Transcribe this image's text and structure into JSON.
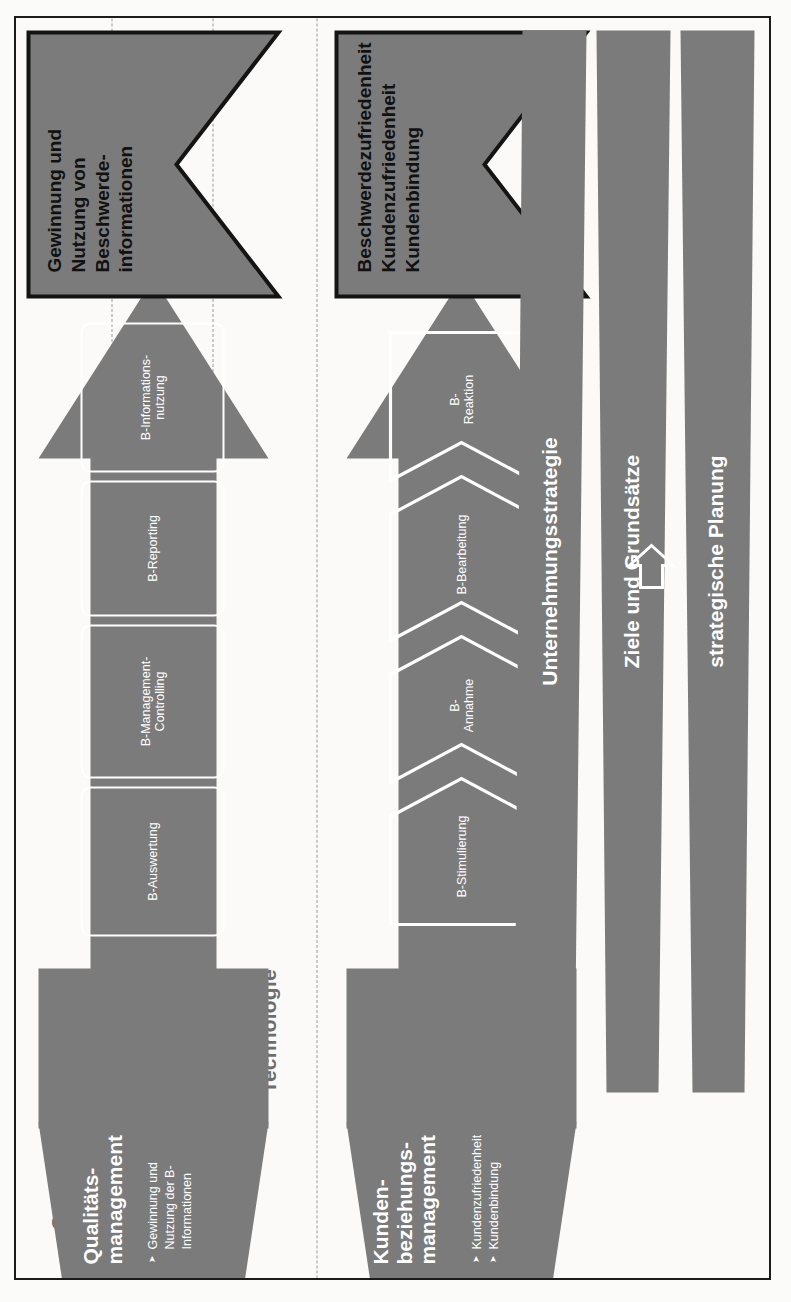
{
  "diagram": {
    "title_banners": [
      {
        "id": "outcome-banner",
        "text": "Beschwerdezufriedenheit\nKundenzufriedenheit\nKundenbindung"
      },
      {
        "id": "information-banner",
        "text": "Gewinnung und\nNutzung von\nBeschwerde-\ninformationen"
      }
    ],
    "band_labels": [
      {
        "label": "Organisation und Kultur"
      },
      {
        "label": "Personal und Know-how"
      },
      {
        "label": "Technologie"
      }
    ],
    "direct_process": {
      "steps": [
        {
          "label": "B-Stimulierung"
        },
        {
          "label": "B-\nAnnahme"
        },
        {
          "label": "B-Bearbeitung"
        },
        {
          "label": "B-\nReaktion"
        }
      ]
    },
    "indirect_process": {
      "steps": [
        {
          "label": "B-Auswertung"
        },
        {
          "label": "B-Management-\nControlling"
        },
        {
          "label": "B-Reporting"
        },
        {
          "label": "B-Informations-\nnutzung"
        }
      ]
    },
    "mid_blocks": [
      {
        "title": "Kunden-\nbeziehungs-\nmanagement",
        "bullets": [
          "Kundenzufriedenheit",
          "Kundenbindung"
        ]
      },
      {
        "title": "Qualitäts-\nmanagement",
        "bullets": [
          "Gewinnung und\nNutzung der B-\nInformationen"
        ]
      }
    ],
    "base_bars": [
      {
        "label": "Ziele und Grundsätze"
      },
      {
        "label": "strategische Planung"
      },
      {
        "label": "Unternehmungsstrategie"
      }
    ],
    "colors": {
      "grey_fill": "#7b7b7b",
      "outline_dark": "#141414",
      "band_label": "#6d6d6d",
      "paper": "#fbfaf8",
      "white": "#ffffff"
    }
  }
}
